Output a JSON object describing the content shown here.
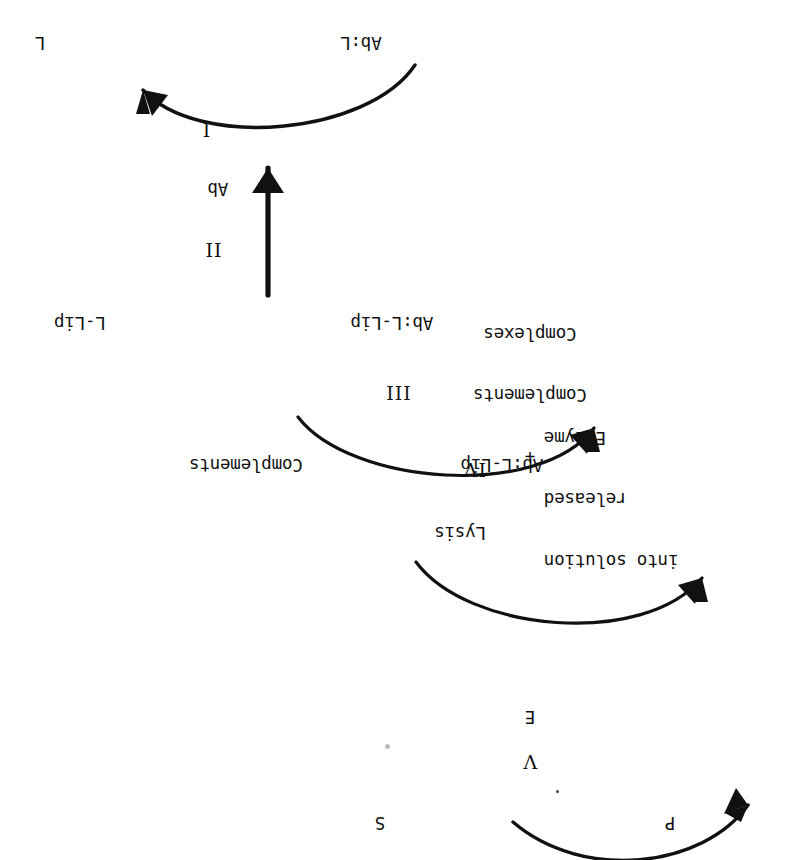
{
  "figure": {
    "orientation_note": "upside-down",
    "background_color": "#ffffff",
    "ink_color": "#111111"
  },
  "steps": {
    "one": "I",
    "two": "II",
    "three": "III",
    "four": "IV",
    "five": "V"
  },
  "labels": {
    "latex": "L",
    "antibody": "Ab",
    "ab_latex": "Ab:L",
    "liposome": "L-Lip",
    "ab_liposome": "Ab:L-Lip",
    "ab_liposome_top": "Ab:L-Lip",
    "ab_liposome_complex_base": "Ab:L-Lip",
    "complements_in": "Complements",
    "plus": "+",
    "complements_complex_1": "Complements",
    "complements_complex_2": "Complexes",
    "enzyme": "E",
    "substrate": "S",
    "product": "P"
  },
  "annotations": {
    "lysis_step": "IV",
    "lysis_label": "Lysis",
    "release_line_1": "Enzyme",
    "release_line_2": "released",
    "release_line_3": "into solution"
  }
}
